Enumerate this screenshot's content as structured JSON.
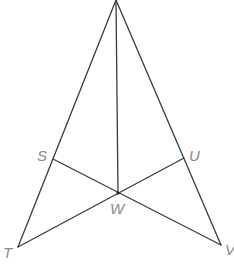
{
  "diagram": {
    "type": "geometry",
    "style": {
      "line_color": "#3a3a3a",
      "label_color": "#8a8a8a"
    },
    "points": {
      "A": {
        "x": 116,
        "y": 0,
        "label": ""
      },
      "S": {
        "x": 53,
        "y": 159,
        "label": "S"
      },
      "U": {
        "x": 184,
        "y": 158,
        "label": "U"
      },
      "W": {
        "x": 118,
        "y": 193,
        "label": "W"
      },
      "T": {
        "x": 18,
        "y": 247,
        "label": "T"
      },
      "V": {
        "x": 221,
        "y": 245,
        "label": "V"
      }
    },
    "segments": [
      [
        "A",
        "T"
      ],
      [
        "A",
        "V"
      ],
      [
        "A",
        "W"
      ],
      [
        "S",
        "V"
      ],
      [
        "T",
        "U"
      ]
    ],
    "labels": [
      {
        "id": "S",
        "text": "S",
        "x": 37,
        "y": 161
      },
      {
        "id": "U",
        "text": "U",
        "x": 189,
        "y": 161
      },
      {
        "id": "W",
        "text": "W",
        "x": 110,
        "y": 214
      },
      {
        "id": "T",
        "text": "T",
        "x": 3,
        "y": 258
      },
      {
        "id": "V",
        "text": "V",
        "x": 225,
        "y": 255
      }
    ]
  }
}
